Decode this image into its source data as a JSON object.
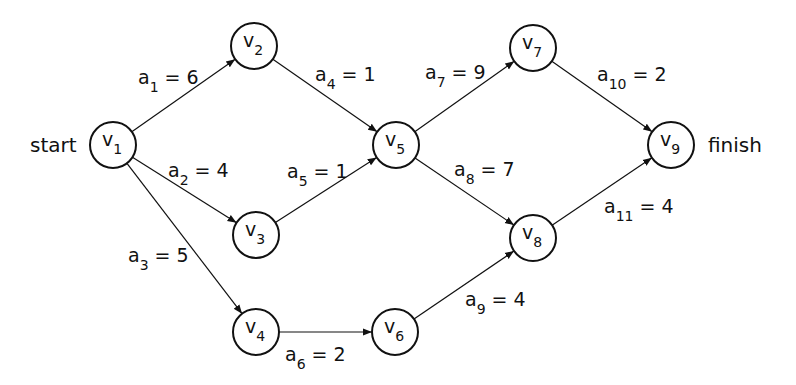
{
  "diagram": {
    "type": "activity-on-edge network",
    "start_label": "start",
    "finish_label": "finish",
    "colors": {
      "stroke": "#111111",
      "background": "#ffffff"
    },
    "nodes": [
      {
        "id": "v1",
        "base": "v",
        "sub": "1",
        "x": 113,
        "y": 145
      },
      {
        "id": "v2",
        "base": "v",
        "sub": "2",
        "x": 254,
        "y": 46
      },
      {
        "id": "v3",
        "base": "v",
        "sub": "3",
        "x": 256,
        "y": 235
      },
      {
        "id": "v4",
        "base": "v",
        "sub": "4",
        "x": 256,
        "y": 332
      },
      {
        "id": "v5",
        "base": "v",
        "sub": "5",
        "x": 396,
        "y": 145
      },
      {
        "id": "v6",
        "base": "v",
        "sub": "6",
        "x": 395,
        "y": 332
      },
      {
        "id": "v7",
        "base": "v",
        "sub": "7",
        "x": 533,
        "y": 48
      },
      {
        "id": "v8",
        "base": "v",
        "sub": "8",
        "x": 533,
        "y": 238
      },
      {
        "id": "v9",
        "base": "v",
        "sub": "9",
        "x": 671,
        "y": 145
      }
    ],
    "edges": [
      {
        "id": "a1",
        "from": "v1",
        "to": "v2",
        "base": "a",
        "sub": "1",
        "value": "6",
        "lx": 138,
        "ly": 84
      },
      {
        "id": "a2",
        "from": "v1",
        "to": "v3",
        "base": "a",
        "sub": "2",
        "value": "4",
        "lx": 168,
        "ly": 177
      },
      {
        "id": "a3",
        "from": "v1",
        "to": "v4",
        "base": "a",
        "sub": "3",
        "value": "5",
        "lx": 128,
        "ly": 262
      },
      {
        "id": "a4",
        "from": "v2",
        "to": "v5",
        "base": "a",
        "sub": "4",
        "value": "1",
        "lx": 315,
        "ly": 81
      },
      {
        "id": "a5",
        "from": "v3",
        "to": "v5",
        "base": "a",
        "sub": "5",
        "value": "1",
        "lx": 287,
        "ly": 178
      },
      {
        "id": "a6",
        "from": "v4",
        "to": "v6",
        "base": "a",
        "sub": "6",
        "value": "2",
        "lx": 285,
        "ly": 361
      },
      {
        "id": "a7",
        "from": "v5",
        "to": "v7",
        "base": "a",
        "sub": "7",
        "value": "9",
        "lx": 425,
        "ly": 79
      },
      {
        "id": "a8",
        "from": "v5",
        "to": "v8",
        "base": "a",
        "sub": "8",
        "value": "7",
        "lx": 454,
        "ly": 176
      },
      {
        "id": "a9",
        "from": "v6",
        "to": "v8",
        "base": "a",
        "sub": "9",
        "value": "4",
        "lx": 465,
        "ly": 306
      },
      {
        "id": "a10",
        "from": "v7",
        "to": "v9",
        "base": "a",
        "sub": "10",
        "value": "2",
        "lx": 597,
        "ly": 81
      },
      {
        "id": "a11",
        "from": "v8",
        "to": "v9",
        "base": "a",
        "sub": "11",
        "value": "4",
        "lx": 604,
        "ly": 213
      }
    ]
  }
}
